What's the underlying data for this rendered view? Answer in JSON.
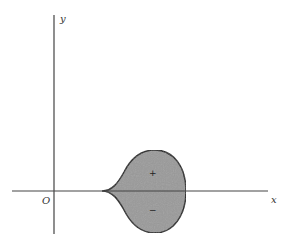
{
  "diagram": {
    "type": "region-plot",
    "axes": {
      "x_label": "x",
      "y_label": "y",
      "origin_label": "O"
    },
    "region": {
      "fill_color": "#9a9a9a",
      "stroke_color": "#1a1a1a",
      "upper_sign": "+",
      "lower_sign": "−"
    },
    "colors": {
      "axis": "#444444",
      "background": "#ffffff"
    }
  }
}
